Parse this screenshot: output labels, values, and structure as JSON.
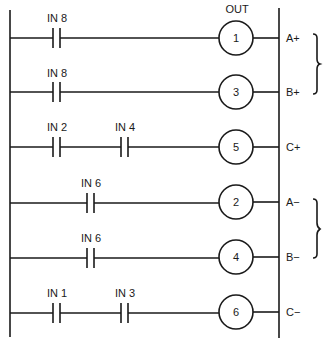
{
  "diagram": {
    "type": "ladder-logic",
    "header": {
      "out_label": "OUT"
    },
    "colors": {
      "ink": "#1a1a1a",
      "background": "#ffffff"
    },
    "rungs": [
      {
        "contacts": [
          "IN 8"
        ],
        "coil": "1",
        "output": "A+"
      },
      {
        "contacts": [
          "IN 8"
        ],
        "coil": "3",
        "output": "B+"
      },
      {
        "contacts": [
          "IN 2",
          "IN 4"
        ],
        "coil": "5",
        "output": "C+"
      },
      {
        "contacts": [
          "IN 6"
        ],
        "coil": "2",
        "output": "A−"
      },
      {
        "contacts": [
          "IN 6"
        ],
        "coil": "4",
        "output": "B−"
      },
      {
        "contacts": [
          "IN 1",
          "IN 3"
        ],
        "coil": "6",
        "output": "C−"
      }
    ],
    "groups": [
      {
        "name": "extend-group",
        "rungs": [
          0,
          1
        ]
      },
      {
        "name": "retract-group",
        "rungs": [
          3,
          4
        ]
      }
    ]
  }
}
